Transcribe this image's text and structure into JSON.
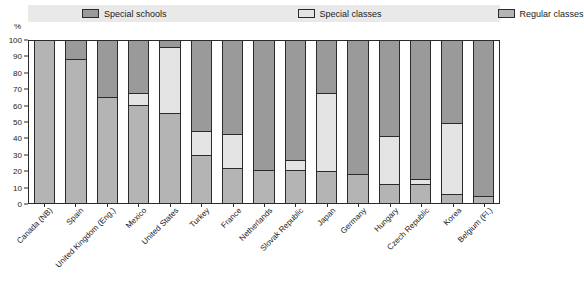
{
  "chart_data": {
    "type": "bar",
    "subtype": "stacked-100-percent",
    "title": "",
    "xlabel": "",
    "ylabel": "%",
    "ylim": [
      0,
      100
    ],
    "yticks": [
      0,
      10,
      20,
      30,
      40,
      50,
      60,
      70,
      80,
      90,
      100
    ],
    "grid": false,
    "legend_position": "top",
    "categories": [
      "Canada (NB)",
      "Spain",
      "United Kingdom (Eng.)",
      "Mexico",
      "United States",
      "Turkey",
      "France",
      "Netherlands",
      "Slovak Republic",
      "Japan",
      "Germany",
      "Hungary",
      "Czech Republic",
      "Korea",
      "Belgium (Fl.)"
    ],
    "series": [
      {
        "name": "Special schools",
        "color": "#9a9a9a",
        "values": [
          0,
          12,
          35,
          33,
          4,
          56,
          58,
          80,
          74,
          33,
          83,
          59,
          86,
          51,
          96
        ]
      },
      {
        "name": "Special classes",
        "color": "#e4e4e4",
        "values": [
          0,
          0,
          0,
          7,
          41,
          15,
          21,
          0,
          6,
          48,
          0,
          30,
          3,
          44,
          0
        ]
      },
      {
        "name": "Regular classes",
        "color": "#b4b4b4",
        "values": [
          100,
          88,
          65,
          60,
          55,
          29,
          21,
          20,
          20,
          19,
          17,
          11,
          11,
          5,
          4
        ]
      }
    ],
    "legend": [
      {
        "label": "Special schools",
        "color": "#9a9a9a"
      },
      {
        "label": "Special classes",
        "color": "#e4e4e4"
      },
      {
        "label": "Regular classes",
        "color": "#b4b4b4"
      }
    ]
  },
  "axis": {
    "y_unit": "%"
  },
  "colors": {
    "legend_background": "#e9e9e9",
    "outline": "#2b2b2b",
    "plot_background": "#ffffff"
  }
}
